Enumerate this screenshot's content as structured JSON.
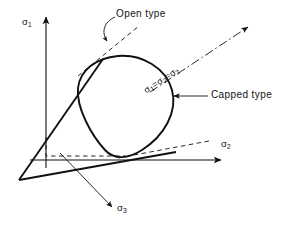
{
  "figure": {
    "background_color": "#ffffff",
    "line_color": "#111111",
    "width": 288,
    "height": 230
  },
  "axes": [
    {
      "id": "sigma1",
      "name": "sigma-1-axis",
      "symbol": "σ",
      "subscript": "1",
      "direction": "vertical-up",
      "arrow": "solid"
    },
    {
      "id": "sigma2",
      "name": "sigma-2-axis",
      "symbol": "σ",
      "subscript": "2",
      "direction": "horizontal-right",
      "arrow": "solid"
    },
    {
      "id": "sigma3",
      "name": "sigma-3-axis",
      "symbol": "σ",
      "subscript": "3",
      "direction": "down-right-foreshortened",
      "arrow": "solid"
    }
  ],
  "hydrostatic_axis": {
    "name": "hydrostatic-axis",
    "label_parts": [
      "σ",
      "1",
      "=",
      "σ",
      "2",
      "=",
      "σ",
      "3"
    ],
    "label_plain": "σ1=σ2=σ3",
    "line_style": "dash-dot",
    "rotation_deg": -33,
    "arrow": "solid"
  },
  "annotations": [
    {
      "id": "open",
      "name": "open-type-annotation",
      "label": "Open type",
      "leader": "curved",
      "arrow": "solid",
      "points_to": "dashed-cone-generator"
    },
    {
      "id": "capped",
      "name": "capped-type-annotation",
      "label": "Capped type",
      "leader": "straight-horizontal",
      "arrow": "solid",
      "points_to": "closed-yield-surface"
    }
  ],
  "surfaces": {
    "cone": {
      "name": "open-cone",
      "description": "Open conical yield surface emanating from origin apex",
      "style": "solid-thick"
    },
    "cap": {
      "name": "capped-surface",
      "description": "Closed rounded-triangular cap curve",
      "style": "solid-thick"
    },
    "construction": {
      "name": "construction-lines",
      "style": "dashed"
    }
  }
}
